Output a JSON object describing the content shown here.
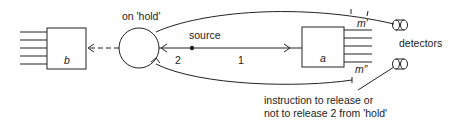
{
  "diagram": {
    "labels": {
      "hold": "on 'hold'",
      "source": "source",
      "path_2": "2",
      "path_1": "1",
      "box_b": "b",
      "box_a": "a",
      "m_prime": "m′",
      "m_double_prime": "m″",
      "detectors": "detectors",
      "instruction_line1": "instruction to release or",
      "instruction_line2": "not to release 2 from 'hold'"
    },
    "colors": {
      "stroke": "#222222",
      "background": "#ffffff"
    }
  }
}
